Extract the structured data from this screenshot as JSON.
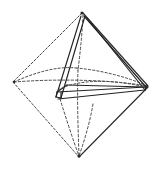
{
  "figure": {
    "style": "vintage line engraving",
    "caption": "",
    "background_color": "#ffffff",
    "line_color": "#2b2b2b",
    "hidden_line_color": "#4a4a4a",
    "canvas": {
      "width": 160,
      "height": 170
    },
    "vertices": {
      "apex_top": {
        "label": "top apex",
        "x": 82,
        "y": 12
      },
      "vertex_left": {
        "label": "left vertex",
        "x": 13,
        "y": 82
      },
      "vertex_right": {
        "label": "right vertex",
        "x": 148,
        "y": 86
      },
      "apex_bottom": {
        "label": "bottom apex",
        "x": 79,
        "y": 157
      },
      "vertex_front": {
        "label": "front vertex",
        "x": 86,
        "y": 100
      },
      "vertex_back": {
        "label": "back vertex",
        "x": 74,
        "y": 68
      }
    },
    "inner_solid": {
      "name": "inscribed tetrahedron",
      "vertices": {
        "apex": {
          "label": "tetra apex",
          "x": 82,
          "y": 15
        },
        "base_left": {
          "label": "tetra base left",
          "x": 56,
          "y": 97
        },
        "base_front": {
          "label": "tetra base front",
          "x": 92,
          "y": 103
        },
        "base_right": {
          "label": "tetra base right",
          "x": 146,
          "y": 88
        },
        "base_back": {
          "label": "tetra base back",
          "x": 64,
          "y": 84
        }
      }
    },
    "edges": {
      "solid_count": 9,
      "dashed_count": 7,
      "stroke_width": 1.1,
      "double_line_offset": 3
    }
  }
}
